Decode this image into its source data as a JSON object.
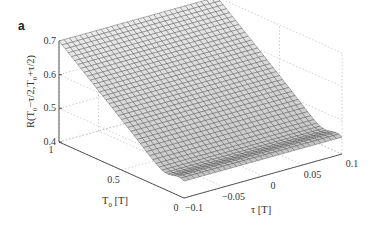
{
  "panel_label": "a",
  "chart_data": {
    "type": "surface",
    "title": "",
    "xlabel": "τ [T]",
    "ylabel": "T_0 [T]",
    "zlabel": "R(T_0−τ/2,T_0+τ/2)",
    "xlim": [
      -0.1,
      0.1
    ],
    "ylim": [
      0,
      1
    ],
    "zlim": [
      0.4,
      0.7
    ],
    "x_ticks": [
      "-0.1",
      "-0.05",
      "0",
      "0.05",
      "0.1"
    ],
    "y_ticks": [
      "0",
      "0.5",
      "1"
    ],
    "z_ticks": [
      "0.4",
      "0.5",
      "0.6",
      "0.7"
    ],
    "grid": true,
    "series": [
      {
        "name": "R surface (approx. profile along T0, at any τ)",
        "T0": [
          1.0,
          0.8,
          0.6,
          0.4,
          0.2,
          0.1,
          0.05,
          0.0
        ],
        "R": [
          0.7,
          0.64,
          0.58,
          0.52,
          0.45,
          0.42,
          0.41,
          0.45
        ]
      }
    ]
  },
  "axes": {
    "z_tick_labels": [
      "0.7",
      "0.6",
      "0.5",
      "0.4"
    ],
    "t0_tick_labels": [
      "1",
      "0.5",
      "0"
    ],
    "tau_tick_labels": [
      "-0.1",
      "-0.05",
      "0",
      "0.05",
      "0.1"
    ],
    "z_label": "R(T",
    "t0_label": "T",
    "tau_label": "τ [T]"
  }
}
